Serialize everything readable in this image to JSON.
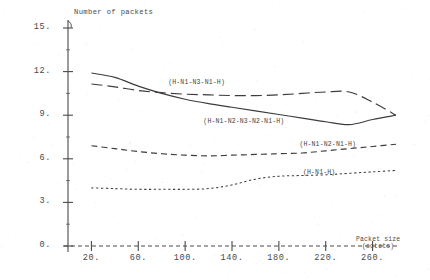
{
  "chart_data": {
    "type": "line",
    "title": "",
    "xlabel": "Packet size (octets)",
    "ylabel": "Number of packets",
    "xlim": [
      0,
      280
    ],
    "ylim": [
      0,
      15
    ],
    "grid": false,
    "legend_position": "inline-labels",
    "x_ticks": [
      20,
      60,
      100,
      140,
      180,
      220,
      260
    ],
    "x_tick_labels": [
      "20.",
      "60.",
      "100.",
      "140.",
      "180.",
      "220.",
      "260."
    ],
    "y_ticks": [
      0,
      3,
      6,
      9,
      12,
      15
    ],
    "y_tick_labels": [
      "0.",
      "3.",
      "6.",
      "9.",
      "12.",
      "15."
    ],
    "series": [
      {
        "name": "(H-N1-N2-N3-N2-N1-H)",
        "style": "solid",
        "label_x": 148,
        "label_y": 8.55,
        "x": [
          20,
          40,
          60,
          80,
          100,
          120,
          140,
          160,
          180,
          200,
          220,
          240,
          260,
          280
        ],
        "values": [
          11.9,
          11.6,
          11.0,
          10.5,
          10.1,
          9.8,
          9.55,
          9.3,
          9.05,
          8.8,
          8.55,
          8.35,
          8.7,
          9.0
        ]
      },
      {
        "name": "(H-N1-N3-N1-H)",
        "style": "long-dash",
        "label_x": 118,
        "label_y": 11.25,
        "x": [
          20,
          40,
          60,
          80,
          100,
          120,
          140,
          160,
          180,
          200,
          220,
          240,
          260,
          280
        ],
        "values": [
          11.15,
          10.95,
          10.7,
          10.55,
          10.45,
          10.4,
          10.35,
          10.35,
          10.4,
          10.5,
          10.6,
          10.6,
          9.9,
          9.0
        ]
      },
      {
        "name": "(H-N1-N2-N1-H)",
        "style": "dash",
        "label_x": 230,
        "label_y": 6.95,
        "x": [
          20,
          40,
          60,
          80,
          100,
          120,
          140,
          160,
          180,
          200,
          220,
          240,
          260,
          280
        ],
        "values": [
          6.9,
          6.7,
          6.5,
          6.35,
          6.25,
          6.2,
          6.25,
          6.3,
          6.35,
          6.4,
          6.55,
          6.7,
          6.85,
          7.0
        ]
      },
      {
        "name": "(H-N1-H)",
        "style": "dot",
        "label_x": 233,
        "label_y": 5.05,
        "x": [
          20,
          40,
          60,
          80,
          100,
          120,
          140,
          160,
          180,
          200,
          220,
          240,
          260,
          280
        ],
        "values": [
          4.0,
          3.95,
          3.9,
          3.9,
          3.9,
          3.95,
          4.2,
          4.6,
          4.8,
          4.85,
          4.9,
          5.0,
          5.1,
          5.2
        ]
      }
    ],
    "colors": {
      "axis": "#4a4a4a",
      "series_line": "#3c3c3c",
      "text": "#4a4a4a",
      "background": "#ffffff"
    }
  }
}
